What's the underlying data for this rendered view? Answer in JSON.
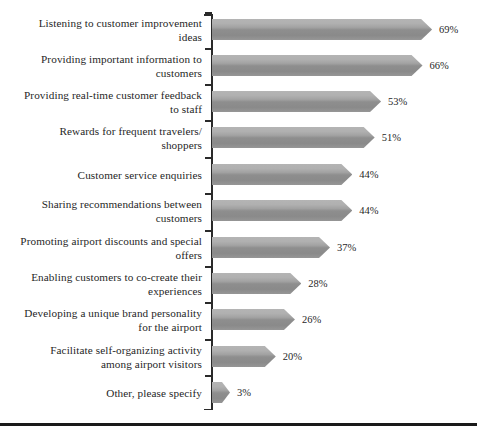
{
  "chart_data": {
    "type": "bar",
    "orientation": "horizontal",
    "title": "",
    "subtitle": "",
    "xlabel": "",
    "ylabel": "",
    "xlim": [
      0,
      75
    ],
    "grid": false,
    "legend": null,
    "value_suffix": "%",
    "bar_style": "arrow",
    "bar_color": "#9a9a9a",
    "axis_color": "#2a2a2a",
    "categories": [
      "Listening to customer improvement\nideas",
      "Providing important information to\ncustomers",
      "Providing real-time customer feedback\nto staff",
      "Rewards for frequent travelers/\nshoppers",
      "Customer service enquiries",
      "Sharing recommendations between\ncustomers",
      "Promoting airport discounts and special\noffers",
      "Enabling customers to co-create their\nexperiences",
      "Developing a unique brand personality\nfor the airport",
      "Facilitate self-organizing activity\namong airport visitors",
      "Other, please specify"
    ],
    "values": [
      69,
      66,
      53,
      51,
      44,
      44,
      37,
      28,
      26,
      20,
      3
    ],
    "value_labels": [
      "69%",
      "66%",
      "53%",
      "51%",
      "44%",
      "44%",
      "37%",
      "28%",
      "26%",
      "20%",
      "3%"
    ]
  }
}
